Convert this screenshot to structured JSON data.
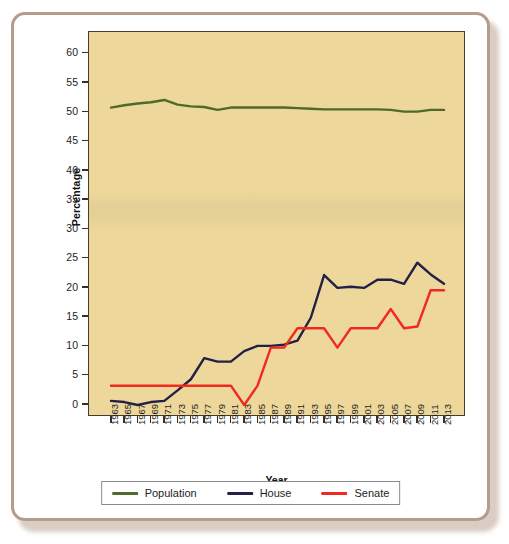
{
  "figure": {
    "frame_color": "#b59c8c",
    "plot_background": "#edd79a",
    "axis_color": "#3a2f22"
  },
  "chart_data": {
    "type": "line",
    "title": "",
    "xlabel": "Year",
    "ylabel": "Percentage",
    "ylim": [
      0,
      62
    ],
    "xlim": [
      1963,
      2013
    ],
    "grid": false,
    "legend_position": "bottom",
    "y_ticks": [
      0,
      5,
      10,
      15,
      20,
      25,
      30,
      35,
      40,
      45,
      50,
      55,
      60
    ],
    "categories": [
      "1963",
      "1965",
      "1967",
      "1969",
      "1971",
      "1973",
      "1975",
      "1977",
      "1979",
      "1981",
      "1983",
      "1985",
      "1987",
      "1989",
      "1991",
      "1993",
      "1995",
      "1997",
      "1999",
      "2001",
      "2003",
      "2005",
      "2007",
      "2009",
      "2011",
      "2013"
    ],
    "series": [
      {
        "name": "Population",
        "color": "#4e6b2a",
        "values": [
          50.8,
          51.2,
          51.5,
          51.7,
          52.1,
          51.3,
          51.0,
          50.9,
          50.4,
          50.8,
          50.8,
          50.8,
          50.8,
          50.8,
          50.7,
          50.6,
          50.5,
          50.5,
          50.5,
          50.5,
          50.5,
          50.4,
          50.1,
          50.1,
          50.4,
          50.4
        ]
      },
      {
        "name": "House",
        "color": "#232047",
        "values": [
          0.7,
          0.5,
          0.0,
          0.5,
          0.7,
          2.5,
          4.4,
          8.0,
          7.4,
          7.4,
          9.2,
          10.1,
          10.1,
          10.3,
          11.0,
          14.9,
          22.2,
          20.0,
          20.2,
          20.0,
          21.4,
          21.4,
          20.7,
          24.3,
          22.3,
          20.7
        ]
      },
      {
        "name": "Senate",
        "color": "#f02a20",
        "values": [
          3.3,
          3.3,
          3.3,
          3.3,
          3.3,
          3.3,
          3.3,
          3.3,
          3.3,
          3.3,
          0.0,
          3.3,
          9.8,
          9.8,
          13.1,
          13.1,
          13.1,
          9.8,
          13.1,
          13.1,
          13.1,
          16.4,
          13.1,
          13.4,
          19.6,
          19.6
        ]
      }
    ]
  },
  "legend": {
    "items": [
      {
        "label": "Population",
        "color": "#4e6b2a",
        "name": "legend-item-population"
      },
      {
        "label": "House",
        "color": "#232047",
        "name": "legend-item-house"
      },
      {
        "label": "Senate",
        "color": "#f02a20",
        "name": "legend-item-senate"
      }
    ]
  }
}
